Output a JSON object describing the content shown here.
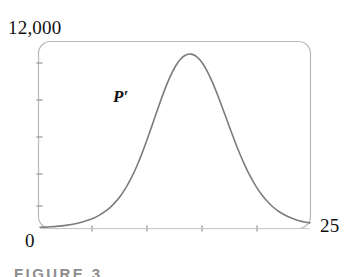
{
  "figure": {
    "caption": "FIGURE 3",
    "curve_label": "P′"
  },
  "axes": {
    "y_max_label": "12,000",
    "x_min_label": "0",
    "x_max_label": "25"
  },
  "chart_data": {
    "type": "line",
    "title": "",
    "subtitle": "",
    "xlabel": "",
    "ylabel": "",
    "xlim": [
      0,
      25
    ],
    "ylim": [
      0,
      12000
    ],
    "grid": false,
    "legend": null,
    "frame": {
      "style": "rounded-rectangle",
      "color": "#b9b9b9",
      "corner_radius": 12
    },
    "x_tick_labels": [
      "0",
      "25"
    ],
    "y_tick_labels": [
      "12,000"
    ],
    "x_ticks": [
      5,
      10,
      15,
      20
    ],
    "y_ticks": [
      2000,
      4000,
      6000,
      8000,
      10000
    ],
    "annotations": [
      {
        "text": "P′",
        "x": 7.0,
        "y": 7700,
        "style": "italic-serif"
      }
    ],
    "series": [
      {
        "name": "P'",
        "color": "#7c7c7c",
        "line_width": 1.6,
        "x": [
          0,
          0.5,
          1,
          1.5,
          2,
          2.5,
          3,
          3.5,
          4,
          4.5,
          5,
          5.5,
          6,
          6.5,
          7,
          7.5,
          8,
          8.5,
          9,
          9.5,
          10,
          10.5,
          11,
          11.5,
          12,
          12.5,
          13,
          13.5,
          14,
          14.5,
          15,
          15.5,
          16,
          16.5,
          17,
          17.5,
          18,
          18.5,
          19,
          19.5,
          20,
          20.5,
          21,
          21.5,
          22,
          22.5,
          23,
          23.5,
          24,
          24.5,
          25
        ],
        "y": [
          60,
          70,
          90,
          115,
          150,
          195,
          250,
          320,
          410,
          520,
          660,
          840,
          1060,
          1340,
          1690,
          2120,
          2650,
          3290,
          4040,
          4900,
          5850,
          6850,
          7850,
          8800,
          9650,
          10350,
          10850,
          11120,
          11180,
          11020,
          10640,
          10060,
          9320,
          8460,
          7530,
          6580,
          5650,
          4780,
          3990,
          3290,
          2690,
          2180,
          1760,
          1410,
          1130,
          910,
          730,
          590,
          480,
          400,
          340
        ]
      }
    ]
  }
}
